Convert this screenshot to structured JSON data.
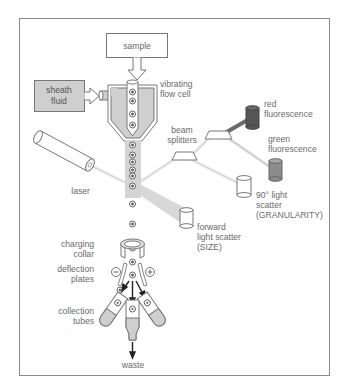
{
  "labels": {
    "sample": "sample",
    "sheath_1": "sheath",
    "sheath_2": "fluid",
    "flow_cell_1": "vibrating",
    "flow_cell_2": "flow cell",
    "laser": "laser",
    "beam_splitters_1": "beam",
    "beam_splitters_2": "splitters",
    "red_1": "red",
    "red_2": "fluorescence",
    "green_1": "green",
    "green_2": "fluorescence",
    "side_1": "90° light",
    "side_2": "scatter",
    "side_3": "(GRANULARITY)",
    "forward_1": "forward",
    "forward_2": "light scatter",
    "forward_3": "(SIZE)",
    "collar_1": "charging",
    "collar_2": "collar",
    "plates_1": "deflection",
    "plates_2": "plates",
    "tubes_1": "collection",
    "tubes_2": "tubes",
    "waste": "waste",
    "minus": "−",
    "plus": "+"
  },
  "colors": {
    "frame": "#8a8a8a",
    "line": "#6e6e6e",
    "fill_gray": "#cfcfcf",
    "beam": "#d6d6d6",
    "red_detector": "#555555",
    "green_detector": "#8c8c8c",
    "text": "#6a6a6a"
  },
  "icons": {
    "particle": "target-circle-icon",
    "detector": "cylinder-icon",
    "arrow": "arrow-down-icon"
  }
}
